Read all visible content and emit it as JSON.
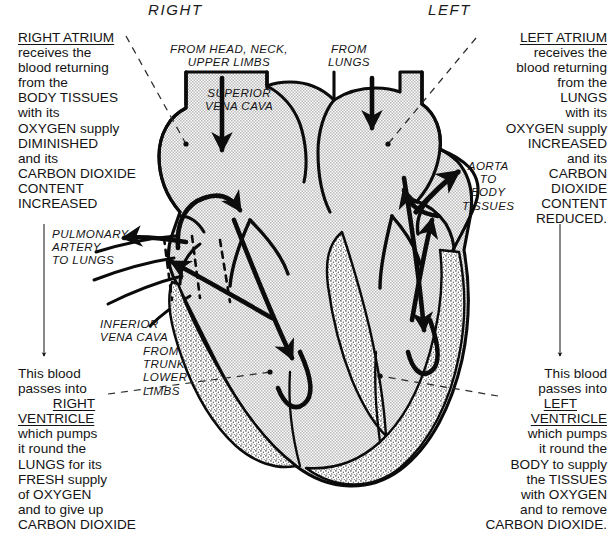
{
  "headers": {
    "right": "RIGHT",
    "left": "LEFT"
  },
  "colors": {
    "ink": "#111111",
    "chamber_fill": "#dcdcdc",
    "muscle_fill": "#cfcfcf",
    "paper": "#ffffff"
  },
  "blocks": {
    "right_atrium": {
      "heading": "RIGHT ATRIUM",
      "lines": [
        "receives the",
        "blood returning",
        "from the",
        "BODY TISSUES",
        "with its",
        "OXYGEN supply",
        "DIMINISHED",
        "and its",
        "CARBON DIOXIDE",
        "CONTENT",
        "INCREASED"
      ]
    },
    "left_atrium": {
      "heading": "LEFT ATRIUM",
      "lines": [
        "receives the",
        "blood returning",
        "from the",
        "LUNGS",
        "with its",
        "OXYGEN supply",
        "INCREASED",
        "and its",
        "CARBON",
        "DIOXIDE",
        "CONTENT",
        "REDUCED."
      ]
    },
    "right_ventricle": {
      "lead_in_1": "This blood",
      "lead_in_2": "passes into",
      "heading_1": "RIGHT",
      "heading_2": "VENTRICLE",
      "lines": [
        "which pumps",
        "it round the",
        "LUNGS for its",
        "FRESH supply",
        "of OXYGEN",
        "and to give up",
        "CARBON DIOXIDE"
      ]
    },
    "left_ventricle": {
      "lead_in_1": "This blood",
      "lead_in_2": "passes into",
      "heading_1": "LEFT",
      "heading_2": "VENTRICLE",
      "lines": [
        "which pumps",
        "it round the",
        "BODY to supply",
        "the TISSUES",
        "with OXYGEN",
        "and to remove",
        "CARBON  DIOXIDE."
      ]
    }
  },
  "vessel_labels": {
    "superior_vena_cava": [
      "SUPERIOR",
      "VENA CAVA"
    ],
    "from_head_neck": [
      "FROM  HEAD, NECK,",
      "UPPER LIMBS"
    ],
    "from_lungs": [
      "FROM",
      "LUNGS"
    ],
    "pulmonary_artery": [
      "PULMONARY",
      "ARTERY",
      "TO LUNGS"
    ],
    "inferior_vena_cava": [
      "INFERIOR",
      "VENA CAVA"
    ],
    "from_trunk": [
      "FROM",
      "TRUNK,",
      "LOWER",
      "LIMBS"
    ],
    "aorta": [
      "AORTA",
      "TO",
      "BODY",
      "TISSUES"
    ]
  }
}
